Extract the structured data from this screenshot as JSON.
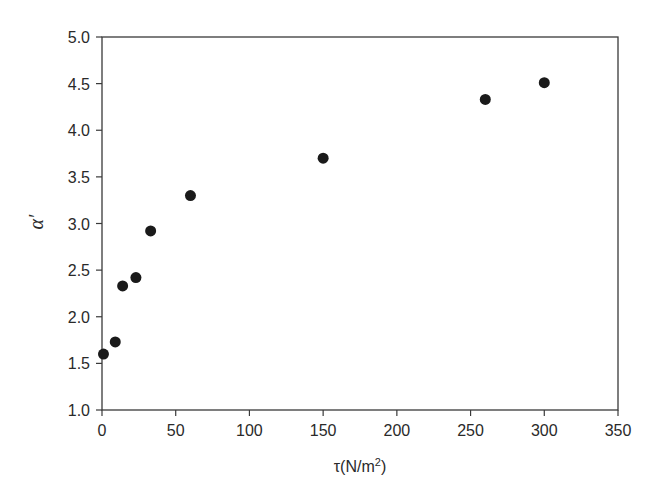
{
  "chart_data": {
    "type": "scatter",
    "title": "",
    "xlabel": "τ(N/m²)",
    "xlabel_parts": {
      "main": "τ(N/m",
      "sup": "2",
      "end": ")"
    },
    "ylabel": "α′",
    "xlim": [
      0,
      350
    ],
    "ylim": [
      1.0,
      5.0
    ],
    "xticks": [
      0,
      50,
      100,
      150,
      200,
      250,
      300,
      350
    ],
    "yticks": [
      1.0,
      1.5,
      2.0,
      2.5,
      3.0,
      3.5,
      4.0,
      4.5,
      5.0
    ],
    "xtick_labels": [
      "0",
      "50",
      "100",
      "150",
      "200",
      "250",
      "300",
      "350"
    ],
    "ytick_labels": [
      "1.0",
      "1.5",
      "2.0",
      "2.5",
      "3.0",
      "3.5",
      "4.0",
      "4.5",
      "5.0"
    ],
    "grid": false,
    "legend": null,
    "marker_color": "#1a1a1a",
    "series": [
      {
        "name": "data",
        "points": [
          {
            "x": 1,
            "y": 1.6
          },
          {
            "x": 9,
            "y": 1.73
          },
          {
            "x": 14,
            "y": 2.33
          },
          {
            "x": 23,
            "y": 2.42
          },
          {
            "x": 33,
            "y": 2.92
          },
          {
            "x": 60,
            "y": 3.3
          },
          {
            "x": 150,
            "y": 3.7
          },
          {
            "x": 260,
            "y": 4.33
          },
          {
            "x": 300,
            "y": 4.51
          }
        ]
      }
    ]
  }
}
